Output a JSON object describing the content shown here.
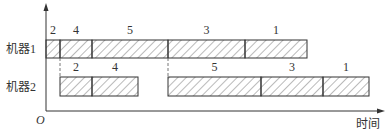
{
  "diagram": {
    "type": "gantt",
    "axis": {
      "origin_label": "O",
      "x_label": "时间"
    },
    "rows": [
      {
        "label": "机器1",
        "tasks": [
          {
            "job": "2",
            "start": 46,
            "end": 60
          },
          {
            "job": "4",
            "start": 60,
            "end": 92
          },
          {
            "job": "5",
            "start": 92,
            "end": 168
          },
          {
            "job": "3",
            "start": 168,
            "end": 245
          },
          {
            "job": "1",
            "start": 245,
            "end": 307
          }
        ]
      },
      {
        "label": "机器2",
        "tasks": [
          {
            "job": "2",
            "start": 60,
            "end": 92
          },
          {
            "job": "4",
            "start": 92,
            "end": 138
          },
          {
            "job": "5",
            "start": 168,
            "end": 261
          },
          {
            "job": "3",
            "start": 261,
            "end": 323
          },
          {
            "job": "1",
            "start": 323,
            "end": 369
          }
        ]
      }
    ],
    "dashed_guides": [
      60,
      168
    ],
    "colors": {
      "line": "#333333",
      "hatch": "#555555",
      "dash": "#777777"
    }
  }
}
